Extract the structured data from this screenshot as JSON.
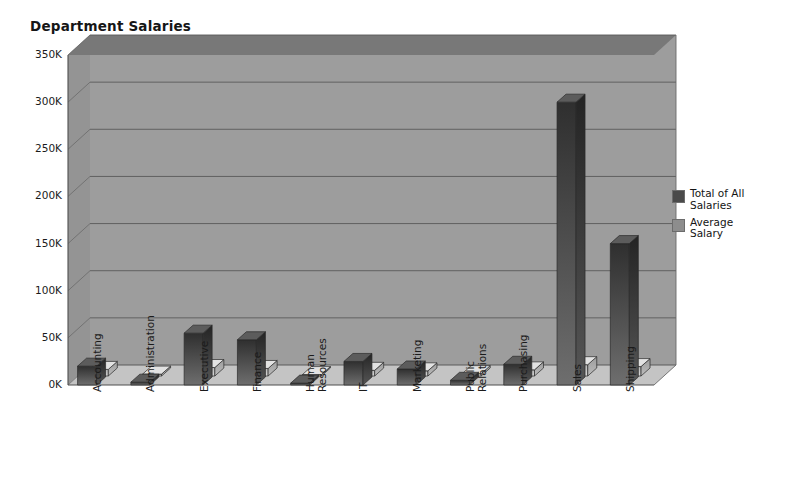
{
  "chart_data": {
    "type": "bar",
    "title": "Department Salaries",
    "subtitle": "",
    "xlabel": "",
    "ylabel": "",
    "categories": [
      "Accounting",
      "Administration",
      "Executive",
      "Finance",
      "Human\nResources",
      "IT",
      "Marketing",
      "Public\nRelations",
      "Purchasing",
      "Sales",
      "Shipping"
    ],
    "series": [
      {
        "name": "Total of All\nSalaries",
        "color": "#3c3c3c",
        "values": [
          20000,
          3000,
          55000,
          48000,
          2000,
          25000,
          17000,
          5000,
          22000,
          300000,
          150000
        ]
      },
      {
        "name": "Average\nSalary",
        "color": "#8d8d8d",
        "values": [
          7000,
          2000,
          9000,
          8000,
          1500,
          6000,
          5500,
          2500,
          6500,
          12000,
          10000
        ]
      }
    ],
    "ylim": [
      0,
      350000
    ],
    "yticks": [
      0,
      50000,
      100000,
      150000,
      200000,
      250000,
      300000,
      350000
    ],
    "ytick_labels": [
      "0K",
      "50K",
      "100K",
      "150K",
      "200K",
      "250K",
      "300K",
      "350K"
    ],
    "grid": true,
    "legend_position": "right",
    "style": "3d-bar",
    "plot_background": "#a9a9a9",
    "wall_background": "#9d9d9d",
    "floor_color": "#c4c4c4",
    "gridline_color": "#5a5a5a",
    "page_background": "#ffffff"
  },
  "legend": {
    "entries": [
      {
        "label": "Total of All\nSalaries",
        "color": "#4a4a4a"
      },
      {
        "label": "Average\nSalary",
        "color": "#8d8d8d"
      }
    ]
  }
}
